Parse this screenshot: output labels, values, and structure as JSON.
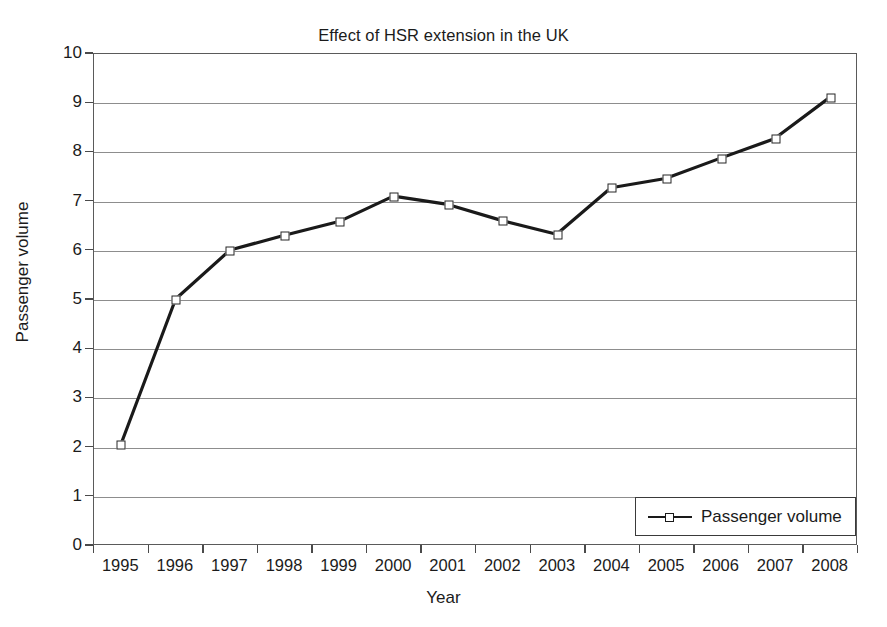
{
  "chart_data": {
    "type": "line",
    "title": "Effect of HSR extension in the UK",
    "xlabel": "Year",
    "ylabel": "Passenger volume",
    "categories": [
      "1995",
      "1996",
      "1997",
      "1998",
      "1999",
      "2000",
      "2001",
      "2002",
      "2003",
      "2004",
      "2005",
      "2006",
      "2007",
      "2008"
    ],
    "x": [
      1995,
      1996,
      1997,
      1998,
      1999,
      2000,
      2001,
      2002,
      2003,
      2004,
      2005,
      2006,
      2007,
      2008
    ],
    "series": [
      {
        "name": "Passenger volume",
        "values": [
          2.05,
          5.0,
          6.0,
          6.3,
          6.58,
          7.1,
          6.93,
          6.6,
          6.32,
          7.27,
          7.46,
          7.87,
          8.27,
          9.1
        ],
        "marker": "open-square",
        "color": "#1a1a1a"
      }
    ],
    "ylim": [
      0,
      10
    ],
    "yticks": [
      0,
      1,
      2,
      3,
      4,
      5,
      6,
      7,
      8,
      9,
      10
    ],
    "ytick_labels": [
      "0",
      "1",
      "2",
      "3",
      "4",
      "5",
      "6",
      "7",
      "8",
      "9",
      "10"
    ],
    "grid": true,
    "grid_axis": "y",
    "legend": {
      "position": "bottom-right",
      "entries": [
        "Passenger volume"
      ]
    }
  },
  "colors": {
    "line": "#1a1a1a",
    "grid": "#8d8d8d",
    "frame": "#5a5a5a",
    "text": "#1b1b1b",
    "background": "#ffffff"
  }
}
